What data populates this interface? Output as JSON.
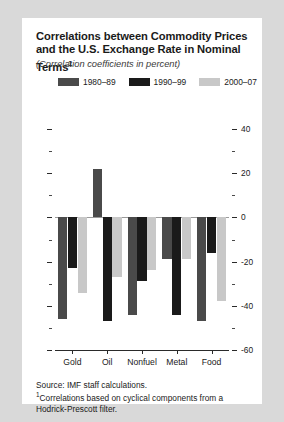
{
  "title": "Correlations between Commodity Prices and the U.S. Exchange Rate in Nominal Terms",
  "title_footnote_marker": "1",
  "subtitle": "(Correlation coefficients in percent)",
  "notes": {
    "source": "Source: IMF staff calculations.",
    "footnote_marker": "1",
    "footnote": "Correlations based on cyclical components from a Hodrick-Prescott filter."
  },
  "colors": {
    "series_1980_89": "#4a4a4a",
    "series_1990_99": "#1a1a1a",
    "series_2000_07": "#c8c8c8",
    "card_background": "#ffffff",
    "page_background": "#d9d9d9",
    "axis": "#2a2a2a"
  },
  "chart_data": {
    "type": "bar",
    "title": "Correlations between Commodity Prices and the U.S. Exchange Rate in Nominal Terms",
    "subtitle": "(Correlation coefficients in percent)",
    "xlabel": "",
    "ylabel": "",
    "categories": [
      "Gold",
      "Oil",
      "Nonfuel",
      "Metal",
      "Food"
    ],
    "series": [
      {
        "name": "1980–89",
        "color": "#4a4a4a",
        "values": [
          -46,
          22,
          -44,
          -19,
          -47
        ]
      },
      {
        "name": "1990–99",
        "color": "#1a1a1a",
        "values": [
          -23,
          -47,
          -29,
          -44,
          -16
        ]
      },
      {
        "name": "2000–07",
        "color": "#c8c8c8",
        "values": [
          -34,
          -27,
          -24,
          -19,
          -38
        ]
      }
    ],
    "ylim": [
      -60,
      40
    ],
    "ytick_labels": [
      "40",
      "20",
      "0",
      "-20",
      "-40",
      "-60"
    ],
    "ytick_values": [
      40,
      20,
      0,
      -20,
      -40,
      -60
    ],
    "yminor_values": [
      30,
      10,
      -10,
      -30,
      -50
    ],
    "grid": false,
    "legend_position": "top",
    "axis_labels_side": "right"
  }
}
